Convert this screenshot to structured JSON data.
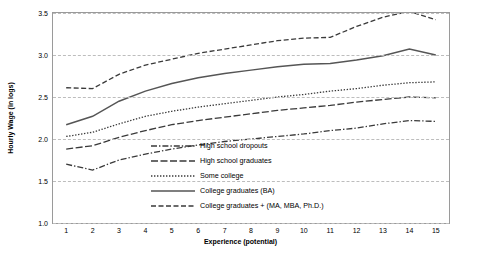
{
  "chart_data": {
    "type": "line",
    "title": "",
    "xlabel": "Experience (potential)",
    "ylabel": "Hourly Wage (in logs)",
    "x": [
      1,
      2,
      3,
      4,
      5,
      6,
      7,
      8,
      9,
      10,
      11,
      12,
      13,
      14,
      15
    ],
    "xlim": [
      0.5,
      15.5
    ],
    "ylim": [
      1.0,
      3.5
    ],
    "yticks": [
      "1.0",
      "1.5",
      "2.0",
      "2.5",
      "3.0",
      "3.5"
    ],
    "xticks": [
      "1",
      "2",
      "3",
      "4",
      "5",
      "6",
      "7",
      "8",
      "9",
      "10",
      "11",
      "12",
      "13",
      "14",
      "15"
    ],
    "grid": "horizontal-dashed",
    "legend_position": "inside-center-right",
    "series": [
      {
        "name": "High school dropouts",
        "style": "dash-dot",
        "color": "#3a3a3a",
        "values": [
          1.7,
          1.63,
          1.75,
          1.82,
          1.88,
          1.93,
          1.97,
          2.0,
          2.03,
          2.06,
          2.1,
          2.13,
          2.18,
          2.22,
          2.21
        ]
      },
      {
        "name": "High school graduates",
        "style": "long-dash",
        "color": "#3a3a3a",
        "values": [
          1.88,
          1.92,
          2.02,
          2.1,
          2.17,
          2.22,
          2.26,
          2.3,
          2.34,
          2.37,
          2.4,
          2.44,
          2.47,
          2.5,
          2.49
        ]
      },
      {
        "name": "Some college",
        "style": "dotted",
        "color": "#3a3a3a",
        "values": [
          2.03,
          2.08,
          2.18,
          2.27,
          2.33,
          2.38,
          2.42,
          2.46,
          2.5,
          2.53,
          2.57,
          2.6,
          2.64,
          2.67,
          2.68
        ]
      },
      {
        "name": "College graduates (BA)",
        "style": "solid",
        "color": "#555555",
        "values": [
          2.17,
          2.27,
          2.45,
          2.57,
          2.66,
          2.73,
          2.78,
          2.82,
          2.86,
          2.89,
          2.9,
          2.94,
          2.99,
          3.07,
          3.0
        ]
      },
      {
        "name": "College graduates + (MA, MBA, Ph.D.)",
        "style": "dashed",
        "color": "#3a3a3a",
        "values": [
          2.61,
          2.6,
          2.77,
          2.88,
          2.95,
          3.02,
          3.07,
          3.12,
          3.17,
          3.2,
          3.21,
          3.34,
          3.45,
          3.52,
          3.42
        ]
      }
    ]
  }
}
